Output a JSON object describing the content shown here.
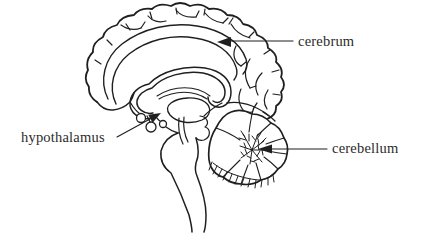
{
  "diagram": {
    "labels": {
      "cerebrum": "cerebrum",
      "hypothalamus": "hypothalamus",
      "cerebellum": "cerebellum"
    },
    "colors": {
      "ink": "#1f1f1f",
      "label_text": "#2b2b2b",
      "background": "#ffffff"
    }
  }
}
